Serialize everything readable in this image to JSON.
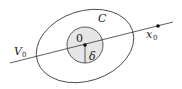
{
  "diagram": {
    "labels": {
      "set_C": "C",
      "origin": "0",
      "radius": "δ",
      "line": "V",
      "line_sub": "0",
      "point": "x",
      "point_sub": "0"
    },
    "colors": {
      "stroke": "#333333",
      "disk_fill": "#e6e6e6",
      "background": "#ffffff"
    },
    "shapes": {
      "ellipse": {
        "cx": 85,
        "cy": 46,
        "rx": 50,
        "ry": 35,
        "rotate": -18
      },
      "disk": {
        "cx": 85,
        "cy": 45,
        "r": 18
      },
      "line": {
        "x1": 10,
        "y1": 63,
        "x2": 173,
        "y2": 22
      },
      "point_x0": {
        "cx": 158,
        "cy": 26
      }
    }
  }
}
